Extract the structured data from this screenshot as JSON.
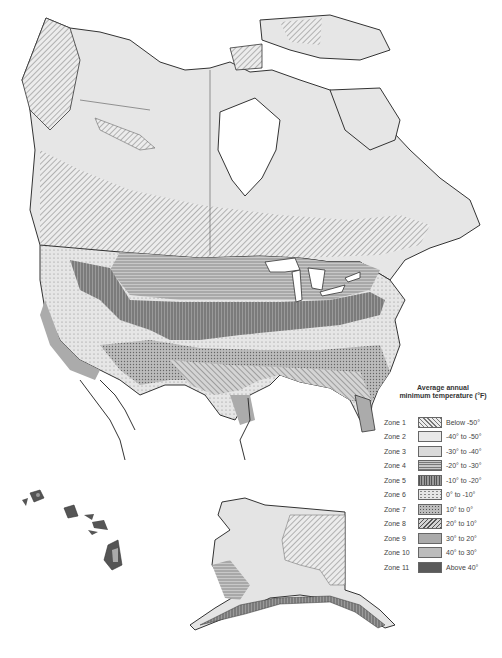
{
  "map": {
    "title": "Plant hardiness zones of North America",
    "regions": [
      "Canada",
      "United States",
      "Alaska",
      "Hawaii",
      "Greenland",
      "Mexico (northern)"
    ]
  },
  "legend": {
    "title_line1": "Average annual",
    "title_line2": "minimum temperature (°F)",
    "zones": [
      {
        "zone": "Zone 1",
        "range": "Below -50°",
        "pattern": "diag-fine",
        "color": "#e8e8e8"
      },
      {
        "zone": "Zone 2",
        "range": "-40° to -50°",
        "pattern": "solid",
        "color": "#e6e6e6"
      },
      {
        "zone": "Zone 3",
        "range": "-30° to -40°",
        "pattern": "solid",
        "color": "#dcdcdc"
      },
      {
        "zone": "Zone 4",
        "range": "-20° to -30°",
        "pattern": "horizontal",
        "color": "#bdbdbd"
      },
      {
        "zone": "Zone 5",
        "range": "-10° to -20°",
        "pattern": "vertical",
        "color": "#8e8e8e"
      },
      {
        "zone": "Zone 6",
        "range": "0° to -10°",
        "pattern": "dots-light",
        "color": "#e2e2e2"
      },
      {
        "zone": "Zone 7",
        "range": "10° to 0°",
        "pattern": "dots-dense",
        "color": "#b4b4b4"
      },
      {
        "zone": "Zone 8",
        "range": "20° to 10°",
        "pattern": "diag-back",
        "color": "#cfcfcf"
      },
      {
        "zone": "Zone 9",
        "range": "30° to 20°",
        "pattern": "solid",
        "color": "#aaaaaa"
      },
      {
        "zone": "Zone 10",
        "range": "40° to 30°",
        "pattern": "solid-grain",
        "color": "#b8b8b8"
      },
      {
        "zone": "Zone 11",
        "range": "Above 40°",
        "pattern": "solid",
        "color": "#5a5a5a"
      }
    ]
  },
  "colors": {
    "outline": "#333333",
    "water": "#ffffff",
    "arctic": "#e4e4e4"
  }
}
